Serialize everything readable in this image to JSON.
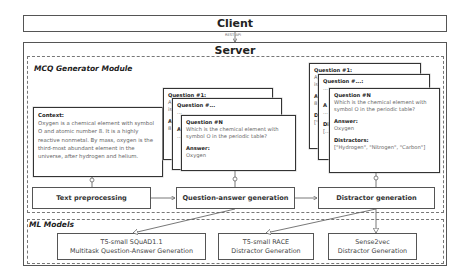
{
  "client": {
    "label": "Client"
  },
  "rest_api": {
    "label": "REST API"
  },
  "server": {
    "label": "Server"
  },
  "mcq_module": {
    "label": "MCQ Generator Module",
    "context_card": {
      "heading": "Context:",
      "text": "Oxygen is a chemical element with symbol O and atomic number 8. It is a highly reactive nonmetal. By mass, oxygen is the third-most abundant element in the universe, after hydrogen and helium."
    },
    "qa_cards": [
      {
        "heading": "Question #1:",
        "line1": "A",
        "line2": "is",
        "answer_label": "A",
        "answer": "8"
      },
      {
        "heading": "Question #...",
        "line1": "...",
        "answer_label": "A",
        "answer": "..."
      },
      {
        "heading": "Question #N",
        "question": "Which is the chemical element with symbol O in the periodic table?",
        "answer_label": "Answer:",
        "answer": "Oxygen"
      }
    ],
    "distractor_cards": [
      {
        "heading": "Question #1:",
        "line1": "A",
        "line2": "is",
        "answer_label": "A",
        "answer": "8",
        "dist_label": "Di",
        "dist": "[\""
      },
      {
        "heading": "Question #...:",
        "line1": "...",
        "answer_label": "A",
        "answer": "...",
        "dist_label": "Di",
        "dist": "[..."
      },
      {
        "heading": "Question #N",
        "question": "Which is the chemical element with symbol O in the periodic table?",
        "answer_label": "Answer:",
        "answer": "Oxygen",
        "dist_label": "Distractors:",
        "dist": "[\"Hydrogen\", \"Nitrogen\", \"Carbon\"]"
      }
    ],
    "steps": [
      {
        "label": "Text preprocessing"
      },
      {
        "label": "Question-answer generation"
      },
      {
        "label": "Distractor generation"
      }
    ]
  },
  "ml_models": {
    "label": "ML Models",
    "models": [
      {
        "line1": "T5-small SQuAD1.1",
        "line2": "Multitask Question-Answer Generation"
      },
      {
        "line1": "T5-small RACE",
        "line2": "Distractor Generation"
      },
      {
        "line1": "Sense2vec",
        "line2": "Distractor Generation"
      }
    ]
  }
}
